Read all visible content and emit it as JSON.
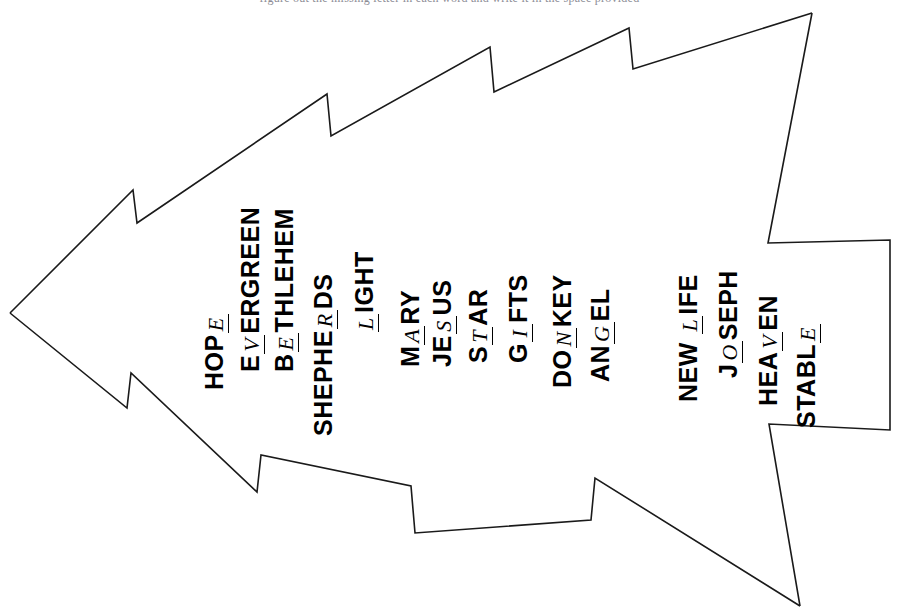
{
  "page": {
    "header_text": "figure out the missing letter in each word and write it in the space provided",
    "background_color": "#ffffff",
    "outline_color": "#1a1a1a",
    "text_color": "#000000",
    "orientation": "rotated-90-counterclockwise",
    "shape": "christmas-tree"
  },
  "words": [
    {
      "id": "hope",
      "before": "HOP",
      "blank": "E",
      "after": "",
      "full": "HOPE"
    },
    {
      "id": "evergreen",
      "before": "E",
      "blank": "V",
      "after": "ERGREEN",
      "full": "EVERGREEN"
    },
    {
      "id": "bethlehem",
      "before": "B",
      "blank": "E",
      "after": "THLEHEM",
      "full": "BETHLEHEM"
    },
    {
      "id": "shepherds",
      "before": "SHEPHE",
      "blank": "R",
      "after": "DS",
      "full": "SHEPHERDS"
    },
    {
      "id": "light",
      "before": "",
      "blank": "L",
      "after": "IGHT",
      "full": "LIGHT"
    },
    {
      "id": "mary",
      "before": "M",
      "blank": "A",
      "after": "RY",
      "full": "MARY"
    },
    {
      "id": "jesus",
      "before": "JE",
      "blank": "S",
      "after": "US",
      "full": "JESUS"
    },
    {
      "id": "star",
      "before": "S",
      "blank": "T",
      "after": "AR",
      "full": "STAR"
    },
    {
      "id": "gifts",
      "before": "G",
      "blank": "I",
      "after": "FTS",
      "full": "GIFTS"
    },
    {
      "id": "donkey",
      "before": "DO",
      "blank": "N",
      "after": "KEY",
      "full": "DONKEY"
    },
    {
      "id": "angel",
      "before": "AN",
      "blank": "G",
      "after": "EL",
      "full": "ANGEL"
    },
    {
      "id": "new-life",
      "before": "NEW ",
      "blank": "L",
      "after": "IFE",
      "full": "NEW LIFE"
    },
    {
      "id": "joseph",
      "before": "J",
      "blank": "O",
      "after": "SEPH",
      "full": "JOSEPH"
    },
    {
      "id": "heaven",
      "before": "HEA",
      "blank": "V",
      "after": "EN",
      "full": "HEAVEN"
    },
    {
      "id": "stable",
      "before": "STABL",
      "blank": "E",
      "after": "",
      "full": "STABLE"
    }
  ]
}
